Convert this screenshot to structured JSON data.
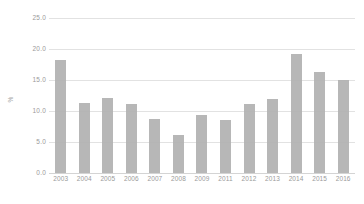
{
  "chart_data": {
    "type": "bar",
    "title": "",
    "xlabel": "",
    "ylabel": "%",
    "ylim": [
      0.0,
      25.0
    ],
    "yticks": [
      "0.0",
      "5.0",
      "10.0",
      "15.0",
      "20.0",
      "25.0"
    ],
    "ytick_values": [
      0.0,
      5.0,
      10.0,
      15.0,
      20.0,
      25.0
    ],
    "grid": true,
    "legend": null,
    "bar_color": "#b1b1b1",
    "grid_color": "#e2e2e2",
    "text_color": "#9a9a9a",
    "categories": [
      "2003",
      "2004",
      "2005",
      "2006",
      "2007",
      "2008",
      "2009",
      "2011",
      "2012",
      "2013",
      "2014",
      "2015",
      "2016"
    ],
    "values": [
      18.2,
      11.3,
      12.1,
      11.1,
      8.7,
      6.1,
      9.4,
      8.5,
      11.2,
      11.9,
      19.2,
      16.3,
      15.0
    ]
  }
}
